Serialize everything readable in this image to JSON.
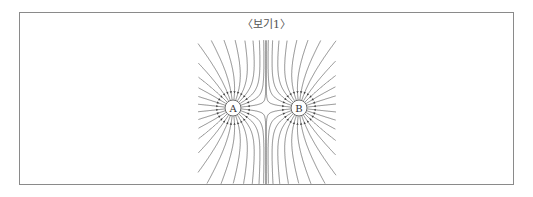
{
  "figure": {
    "title": "〈보기1〉",
    "charges": [
      {
        "label": "A",
        "cx": 233,
        "cy": 108,
        "r": 8
      },
      {
        "label": "B",
        "cx": 299,
        "cy": 108,
        "r": 8
      }
    ],
    "line_color": "#444444",
    "border_color": "#8a8a8a"
  }
}
